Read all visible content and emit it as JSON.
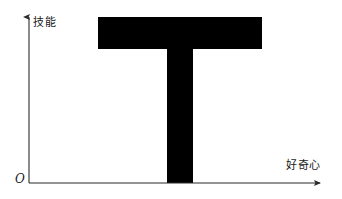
{
  "figure": {
    "background_color": "#ffffff",
    "axis_color": "#2b2b2b",
    "shape_color": "#000000",
    "text_color": "#1a1a1a"
  },
  "axes": {
    "y_label": "技能",
    "x_label": "好奇心",
    "origin_label": "O"
  },
  "chart_data": {
    "type": "area",
    "title": "",
    "subtitle": "",
    "xlabel": "好奇心",
    "ylabel": "技能",
    "annotations": [
      "O"
    ],
    "legend": [],
    "grid": false,
    "xlim": [
      0,
      100
    ],
    "ylim": [
      0,
      100
    ],
    "xticks": [],
    "yticks": [],
    "series": [
      {
        "name": "T-shape",
        "kind": "polygon",
        "fill": "#000000",
        "points_px": [
          [
            98,
            17
          ],
          [
            262,
            17
          ],
          [
            262,
            49
          ],
          [
            193,
            49
          ],
          [
            193,
            183
          ],
          [
            167,
            183
          ],
          [
            167,
            49
          ],
          [
            98,
            49
          ]
        ],
        "crossbar": {
          "x_start": 98,
          "x_end": 262,
          "y_top": 17,
          "y_bottom": 49,
          "width_px": 164,
          "height_px": 32
        },
        "stem": {
          "x_start": 167,
          "x_end": 193,
          "y_top": 49,
          "y_bottom": 183,
          "width_px": 26,
          "height_px": 134
        }
      }
    ],
    "axis_geometry_px": {
      "origin": [
        29,
        183
      ],
      "y_axis_top": [
        29,
        13
      ],
      "x_axis_right": [
        327,
        183
      ],
      "arrow_size": 6
    }
  }
}
